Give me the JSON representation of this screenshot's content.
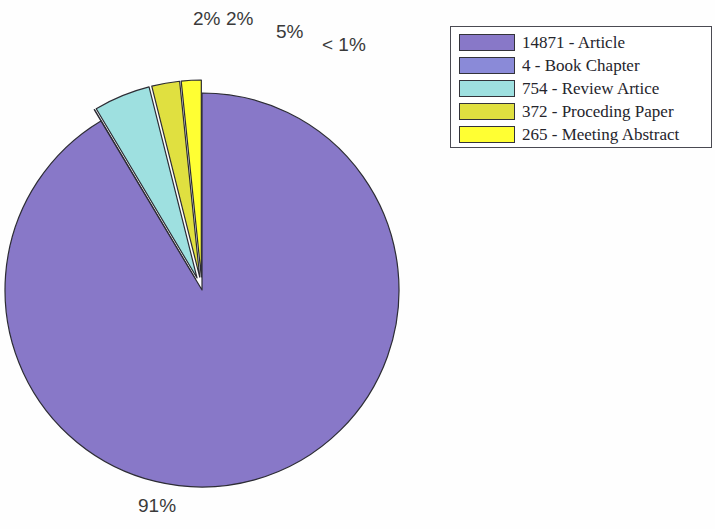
{
  "chart_data": {
    "type": "pie",
    "title": "",
    "subtitle": "",
    "xlabel": "",
    "ylabel": "",
    "legend_position": "top-right",
    "grid": false,
    "total": 16266,
    "categories": [
      "Article",
      "Book Chapter",
      "Review Artice",
      "Proceding Paper",
      "Meeting Abstract"
    ],
    "values": [
      14871,
      4,
      754,
      372,
      265
    ],
    "percent_labels": [
      "91%",
      "< 1%",
      "5%",
      "2%",
      "2%"
    ],
    "colors": [
      "#8878c8",
      "#8a8ad8",
      "#9ee0e0",
      "#e0e040",
      "#ffff33"
    ],
    "exploded": [
      false,
      true,
      true,
      true,
      true
    ],
    "slices": [
      {
        "name": "article-slice",
        "legend_label": "14871 - Article",
        "count": "14871",
        "category": "Article",
        "percent_label": "91%",
        "value": 14871,
        "percent": 91,
        "color": "#8878c8",
        "exploded": false
      },
      {
        "name": "book-chapter-slice",
        "legend_label": "4 - Book Chapter",
        "count": "4",
        "category": "Book Chapter",
        "percent_label": "< 1%",
        "value": 4,
        "percent": 0.02,
        "color": "#8a8ad8",
        "exploded": true
      },
      {
        "name": "review-article-slice",
        "legend_label": "754 - Review Artice",
        "count": "754",
        "category": "Review Artice",
        "percent_label": "5%",
        "value": 754,
        "percent": 4.64,
        "color": "#9ee0e0",
        "exploded": true
      },
      {
        "name": "proceeding-paper-slice",
        "legend_label": "372 - Proceding Paper",
        "count": "372",
        "category": "Proceding Paper",
        "percent_label": "2%",
        "value": 372,
        "percent": 2.29,
        "color": "#e0e040",
        "exploded": true
      },
      {
        "name": "meeting-abstract-slice",
        "legend_label": "265 - Meeting Abstract",
        "count": "265",
        "category": "Meeting Abstract",
        "percent_label": "2%",
        "value": 265,
        "percent": 1.63,
        "color": "#ffff33",
        "exploded": true
      }
    ]
  },
  "legend": {
    "items": [
      {
        "label": "14871 - Article",
        "color": "#8878c8"
      },
      {
        "label": "4 - Book Chapter",
        "color": "#8a8ad8"
      },
      {
        "label": "754 - Review Artice",
        "color": "#9ee0e0"
      },
      {
        "label": "372 - Proceding Paper",
        "color": "#e0e040"
      },
      {
        "label": "265 - Meeting Abstract",
        "color": "#ffff33"
      }
    ]
  },
  "labels": {
    "article": "91%",
    "book_chapter": "< 1%",
    "review_article": "5%",
    "proceeding_paper": "2%",
    "meeting_abstract": "2%"
  }
}
